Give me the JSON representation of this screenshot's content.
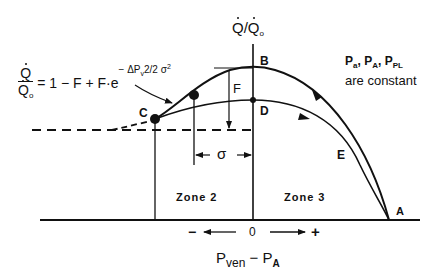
{
  "diagram": {
    "y_axis_label": {
      "num": "Q",
      "den": "Q",
      "den_sub": "o"
    },
    "x_axis_label": {
      "main": "P",
      "main_sub": "ven",
      "minus": " − ",
      "second": "P",
      "second_sub": "A"
    },
    "x_direction": {
      "neg": "−",
      "zero": "0",
      "pos": "+"
    },
    "formula": {
      "lhs_num": "Q",
      "lhs_den": "Q",
      "lhs_den_sub": "o",
      "rhs": "= 1 − F + F·e",
      "exponent": "− ΔP",
      "exponent_sub": "v",
      "exponent_tail": "2/2 σ",
      "exponent_sq": "2"
    },
    "constants_note": {
      "line1_parts": [
        {
          "p": "P",
          "sub": "a"
        },
        {
          "p": "P",
          "sub": "A"
        },
        {
          "p": "P",
          "sub": "PL"
        }
      ],
      "separator": ",",
      "line2": "are constant"
    },
    "points": {
      "A": "A",
      "B": "B",
      "C": "C",
      "D": "D",
      "E": "E"
    },
    "dimensions": {
      "F": "F",
      "sigma": "σ"
    },
    "zones": {
      "zone2": "Zone  2",
      "zone3": "Zone  3"
    }
  }
}
